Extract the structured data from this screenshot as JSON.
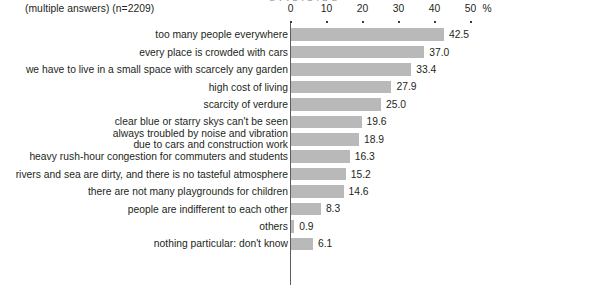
{
  "subtitle": "(multiple answers) (n=2209)",
  "title_remnant": "g y , p , p , p g",
  "axis": {
    "unit_label": "%",
    "ticks": [
      0,
      10,
      20,
      30,
      40,
      50
    ],
    "tick_labels": [
      "0",
      "10",
      "20",
      "30",
      "40",
      "50"
    ]
  },
  "colors": {
    "bar": "#b9b9b9",
    "text": "#231f20",
    "axis": "#5d5d5d"
  },
  "chart_data": {
    "type": "bar",
    "orientation": "horizontal",
    "title": "",
    "subtitle": "(multiple answers) (n=2209)",
    "xlabel": "%",
    "ylabel": "",
    "xlim": [
      0,
      50
    ],
    "grid": false,
    "legend": false,
    "categories": [
      "too many people everywhere",
      "every place is crowded with cars",
      "we have to live in a small space with scarcely any garden",
      "high cost of living",
      "scarcity of verdure",
      "clear blue or starry skys can't be seen",
      "always troubled by noise and vibration due to cars and construction work",
      "heavy rush-hour congestion for commuters and students",
      "rivers and sea are dirty, and there is no tasteful atmosphere",
      "there are not many playgrounds for children",
      "people are indifferent to each other",
      "others",
      "nothing particular: don't know"
    ],
    "values": [
      42.5,
      37.0,
      33.4,
      27.9,
      25.0,
      19.6,
      18.9,
      16.3,
      15.2,
      14.6,
      8.3,
      0.9,
      6.1
    ],
    "value_labels": [
      "42.5",
      "37.0",
      "33.4",
      "27.9",
      "25.0",
      "19.6",
      "18.9",
      "16.3",
      "15.2",
      "14.6",
      "8.3",
      "0.9",
      "6.1"
    ]
  },
  "rows": [
    {
      "label": "too many people everywhere",
      "label_line1": "too many people everywhere",
      "label_line2": "",
      "value": 42.5,
      "value_label": "42.5"
    },
    {
      "label": "every place is crowded with cars",
      "label_line1": "every place is crowded with cars",
      "label_line2": "",
      "value": 37.0,
      "value_label": "37.0"
    },
    {
      "label": "we have to live in a small space with scarcely any garden",
      "label_line1": "we have to live in a small space with scarcely any garden",
      "label_line2": "",
      "value": 33.4,
      "value_label": "33.4"
    },
    {
      "label": "high cost of living",
      "label_line1": "high cost of living",
      "label_line2": "",
      "value": 27.9,
      "value_label": "27.9"
    },
    {
      "label": "scarcity of verdure",
      "label_line1": "scarcity of verdure",
      "label_line2": "",
      "value": 25.0,
      "value_label": "25.0"
    },
    {
      "label": "clear blue or starry skys can't be seen",
      "label_line1": "clear blue or starry skys can't be seen",
      "label_line2": "",
      "value": 19.6,
      "value_label": "19.6"
    },
    {
      "label": "always troubled by noise and vibration due to cars and construction work",
      "label_line1": "always troubled by noise and vibration",
      "label_line2": "due to cars and construction work",
      "value": 18.9,
      "value_label": "18.9"
    },
    {
      "label": "heavy rush-hour congestion for commuters and students",
      "label_line1": "heavy rush-hour congestion for commuters and students",
      "label_line2": "",
      "value": 16.3,
      "value_label": "16.3"
    },
    {
      "label": "rivers and sea are dirty, and there is no tasteful atmosphere",
      "label_line1": "rivers and sea are dirty, and there is no tasteful atmosphere",
      "label_line2": "",
      "value": 15.2,
      "value_label": "15.2"
    },
    {
      "label": "there are not many playgrounds for children",
      "label_line1": "there are not many playgrounds for children",
      "label_line2": "",
      "value": 14.6,
      "value_label": "14.6"
    },
    {
      "label": "people are indifferent to each other",
      "label_line1": "people are indifferent to each other",
      "label_line2": "",
      "value": 8.3,
      "value_label": "8.3"
    },
    {
      "label": "others",
      "label_line1": "others",
      "label_line2": "",
      "value": 0.9,
      "value_label": "0.9"
    },
    {
      "label": "nothing particular: don't know",
      "label_line1": "nothing particular: don't know",
      "label_line2": "",
      "value": 6.1,
      "value_label": "6.1"
    }
  ]
}
